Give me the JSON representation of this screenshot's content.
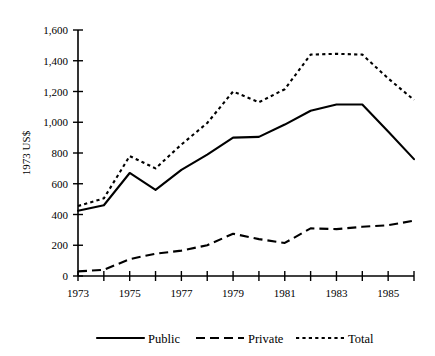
{
  "chart_data": {
    "type": "line",
    "title": "",
    "xlabel": "",
    "ylabel": "1973 US$",
    "x": [
      1973,
      1974,
      1975,
      1976,
      1977,
      1978,
      1979,
      1980,
      1981,
      1982,
      1983,
      1984,
      1985,
      1986
    ],
    "xlim": [
      1973,
      1986
    ],
    "ylim": [
      0,
      1600
    ],
    "yticks": [
      0,
      200,
      400,
      600,
      800,
      1000,
      1200,
      1400,
      1600
    ],
    "ytick_labels": [
      "0",
      "200",
      "400",
      "600",
      "800",
      "1,000",
      "1,200",
      "1,400",
      "1,600"
    ],
    "xtick_labels": [
      "1973",
      "",
      "1975",
      "",
      "1977",
      "",
      "1979",
      "",
      "1981",
      "",
      "1983",
      "",
      "1985",
      ""
    ],
    "xtick_labels_shown": [
      "1973",
      "1975",
      "1977",
      "1979",
      "1981",
      "1983",
      "1985"
    ],
    "grid": false,
    "legend_position": "bottom",
    "series": [
      {
        "name": "Public",
        "style": "solid",
        "values": [
          425,
          460,
          670,
          560,
          690,
          790,
          900,
          905,
          985,
          1075,
          1115,
          1115,
          940,
          760
        ]
      },
      {
        "name": "Private",
        "style": "dashed",
        "values": [
          30,
          40,
          110,
          145,
          165,
          200,
          275,
          240,
          215,
          310,
          305,
          320,
          330,
          360
        ]
      },
      {
        "name": "Total",
        "style": "dotted",
        "values": [
          455,
          505,
          780,
          700,
          855,
          995,
          1200,
          1130,
          1215,
          1440,
          1445,
          1440,
          1285,
          1145
        ]
      }
    ]
  },
  "legend": {
    "items": [
      {
        "label": "Public",
        "style": "solid"
      },
      {
        "label": "Private",
        "style": "dashed"
      },
      {
        "label": "Total",
        "style": "dotted"
      }
    ]
  },
  "axes": {
    "y_axis_title": "1973 US$"
  }
}
